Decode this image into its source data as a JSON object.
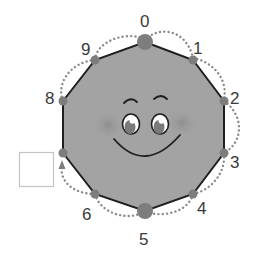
{
  "diagram": {
    "shape": "decagon",
    "colors": {
      "fill": "#a3a3a3",
      "stroke": "#1e1e1e",
      "dot": "#7d7d7d",
      "dotted_path": "#8a8a8a",
      "cheek": "#8f8f8f"
    },
    "vertex_labels": {
      "v0": "0",
      "v1": "1",
      "v2": "2",
      "v3": "3",
      "v4": "4",
      "v5": "5",
      "v6": "6",
      "v7": "",
      "v8": "8",
      "v9": "9"
    },
    "answer_box": {
      "value": "",
      "for_vertex": "7"
    },
    "face": "smiley"
  }
}
